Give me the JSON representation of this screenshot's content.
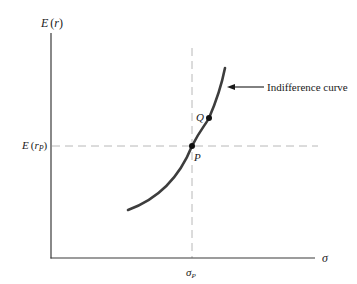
{
  "figure": {
    "y_axis_label": {
      "base": "E",
      "open": "(",
      "var": "r",
      "close": ")"
    },
    "x_axis_label": "σ",
    "y_tick_label": {
      "base": "E",
      "open": "(",
      "var": "r",
      "sub": "P",
      "close": ")"
    },
    "x_tick_label": {
      "base": "σ",
      "sub": "P"
    },
    "points": [
      {
        "name": "P",
        "label": "P"
      },
      {
        "name": "Q",
        "label": "Q"
      }
    ],
    "annotation": "Indifference curve"
  },
  "colors": {
    "axis": "#3a3a3a",
    "curve": "#3d3d3d",
    "dashed": "#b8b8b8",
    "point": "#111111",
    "text": "#1a1a1a"
  }
}
